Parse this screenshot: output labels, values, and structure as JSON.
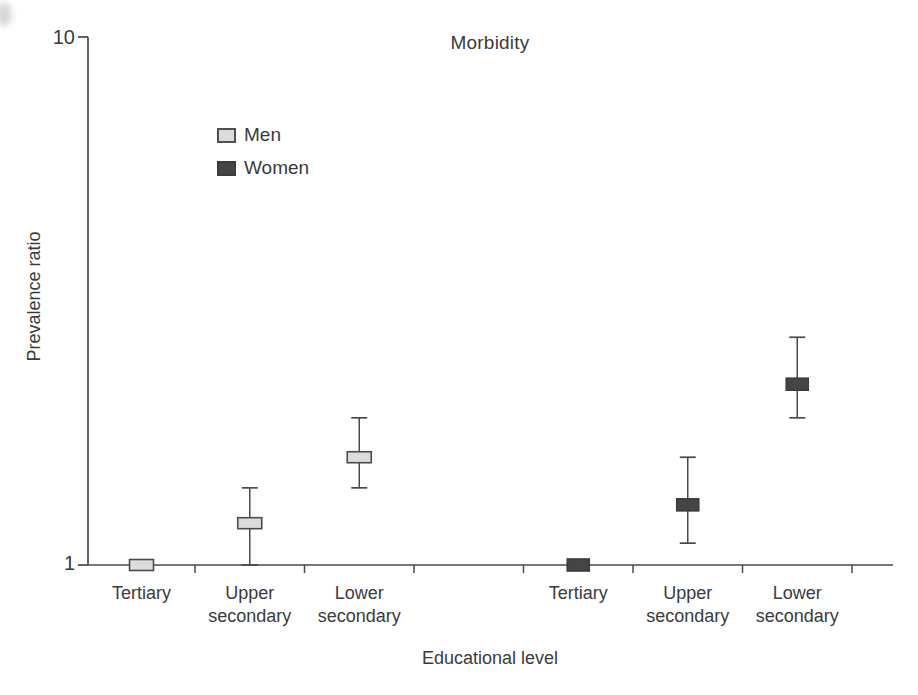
{
  "chart_data": {
    "type": "scatter",
    "subtype": "point-estimate-with-error-bars",
    "title": "Morbidity",
    "xlabel": "Educational level",
    "ylabel": "Prevalence ratio",
    "yscale": "log",
    "ylim": [
      1,
      10
    ],
    "ytick_labels": [
      "1",
      "10"
    ],
    "grid": false,
    "legend_position": "upper-left-inside",
    "categories": [
      "Tertiary",
      "Upper secondary",
      "Lower secondary",
      "Tertiary",
      "Upper secondary",
      "Lower secondary"
    ],
    "series": [
      {
        "name": "Men",
        "color": "#dcdcda",
        "border_color": "#4c4c4e",
        "points": [
          {
            "category": "Tertiary",
            "slot": 0,
            "value": 1.0,
            "ci_low": 1.0,
            "ci_high": 1.0
          },
          {
            "category": "Upper secondary",
            "slot": 1,
            "value": 1.2,
            "ci_low": 1.0,
            "ci_high": 1.4
          },
          {
            "category": "Lower secondary",
            "slot": 2,
            "value": 1.6,
            "ci_low": 1.4,
            "ci_high": 1.9
          }
        ]
      },
      {
        "name": "Women",
        "color": "#454547",
        "border_color": "#3c3c3e",
        "points": [
          {
            "category": "Tertiary",
            "slot": 4,
            "value": 1.0,
            "ci_low": 1.0,
            "ci_high": 1.0
          },
          {
            "category": "Upper secondary",
            "slot": 5,
            "value": 1.3,
            "ci_low": 1.1,
            "ci_high": 1.6
          },
          {
            "category": "Lower secondary",
            "slot": 6,
            "value": 2.2,
            "ci_low": 1.9,
            "ci_high": 2.7
          }
        ]
      }
    ]
  }
}
